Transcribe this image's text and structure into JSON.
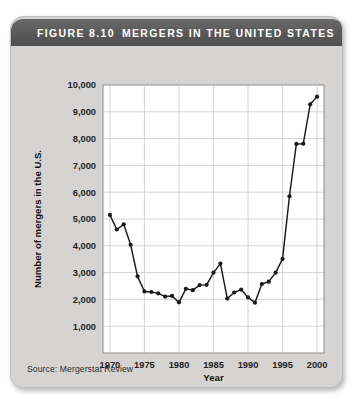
{
  "figure": {
    "number_label": "FIGURE 8.10",
    "title": "MERGERS IN THE UNITED STATES",
    "source": "Source: Mergerstat Review",
    "header_color": "#5a5a5a",
    "card_color": "#d6d4d2",
    "plot_bg_color": "#ffffff",
    "line_color": "#1a1a1a",
    "grid_color": "#d0d0d0"
  },
  "chart_data": {
    "type": "line",
    "title": "MERGERS IN THE UNITED STATES",
    "xlabel": "Year",
    "ylabel": "Number of mergers in the U.S.",
    "xlim": [
      1969,
      2001
    ],
    "ylim": [
      0,
      10000
    ],
    "xticks": [
      1970,
      1975,
      1980,
      1985,
      1990,
      1995,
      2000
    ],
    "xtick_labels": [
      "1970",
      "1975",
      "1980",
      "1985",
      "1990",
      "1995",
      "2000"
    ],
    "yticks": [
      1000,
      2000,
      3000,
      4000,
      5000,
      6000,
      7000,
      8000,
      9000,
      10000
    ],
    "ytick_labels": [
      "1,000",
      "2,000",
      "3,000",
      "4,000",
      "5,000",
      "6,000",
      "7,000",
      "8,000",
      "9,000",
      "10,000"
    ],
    "grid": true,
    "legend": false,
    "markers": true,
    "x": [
      1970,
      1971,
      1972,
      1973,
      1974,
      1975,
      1976,
      1977,
      1978,
      1979,
      1980,
      1981,
      1982,
      1983,
      1984,
      1985,
      1986,
      1987,
      1988,
      1989,
      1990,
      1991,
      1992,
      1993,
      1994,
      1995,
      1996,
      1997,
      1998,
      1999,
      2000
    ],
    "values": [
      5152,
      4608,
      4801,
      4040,
      2861,
      2297,
      2276,
      2224,
      2106,
      2128,
      1889,
      2395,
      2346,
      2533,
      2543,
      3001,
      3336,
      2032,
      2258,
      2366,
      2074,
      1877,
      2574,
      2663,
      2997,
      3510,
      5848,
      7800,
      7809,
      9278,
      9566
    ]
  }
}
